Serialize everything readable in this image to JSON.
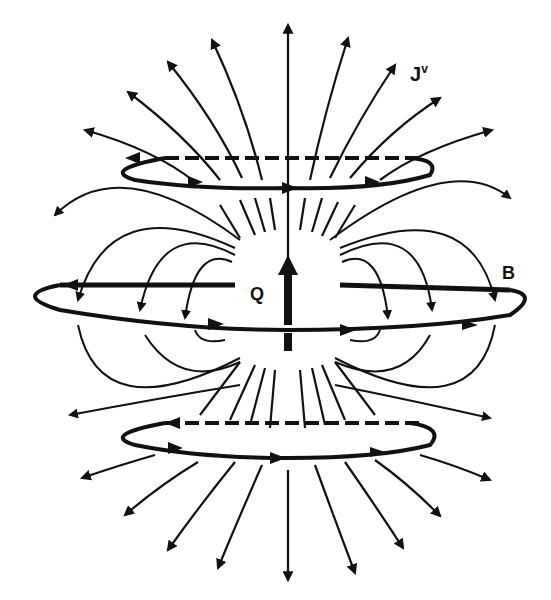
{
  "diagram": {
    "labels": {
      "current": "J",
      "current_superscript": "v",
      "ring": "B",
      "charge": "Q"
    },
    "colors": {
      "ink": "#111111",
      "background": "#ffffff"
    }
  }
}
